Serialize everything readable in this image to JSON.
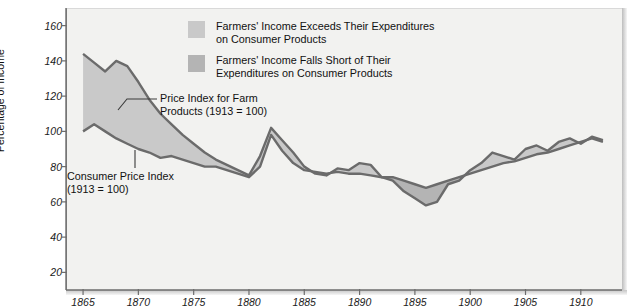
{
  "chart_data": {
    "type": "area",
    "title": "",
    "xlabel": "",
    "ylabel": "Percentage of Income",
    "xlim": [
      1864,
      1913
    ],
    "ylim": [
      10,
      170
    ],
    "yticks": [
      20,
      40,
      60,
      80,
      100,
      120,
      140,
      160
    ],
    "xticks": [
      1865,
      1870,
      1875,
      1880,
      1885,
      1890,
      1895,
      1900,
      1905,
      1910
    ],
    "grid": false,
    "legend_position": "top-center",
    "x": [
      1865,
      1866,
      1867,
      1868,
      1869,
      1870,
      1871,
      1872,
      1873,
      1874,
      1875,
      1876,
      1877,
      1878,
      1879,
      1880,
      1881,
      1882,
      1883,
      1884,
      1885,
      1886,
      1887,
      1888,
      1889,
      1890,
      1891,
      1892,
      1893,
      1894,
      1895,
      1896,
      1897,
      1898,
      1899,
      1900,
      1901,
      1902,
      1903,
      1904,
      1905,
      1906,
      1907,
      1908,
      1909,
      1910,
      1911,
      1912
    ],
    "series": [
      {
        "name": "Price Index for Farm Products (1913 = 100)",
        "values": [
          144,
          139,
          134,
          140,
          137,
          128,
          118,
          110,
          104,
          98,
          93,
          88,
          84,
          81,
          78,
          75,
          86,
          102,
          95,
          88,
          80,
          76,
          75,
          79,
          78,
          82,
          81,
          74,
          72,
          66,
          62,
          58,
          60,
          70,
          72,
          78,
          82,
          88,
          86,
          84,
          90,
          92,
          89,
          94,
          96,
          93,
          97,
          95
        ]
      },
      {
        "name": "Consumer Price Index (1913 = 100)",
        "values": [
          100,
          104,
          100,
          96,
          93,
          90,
          88,
          85,
          86,
          84,
          82,
          80,
          80,
          78,
          76,
          74,
          80,
          98,
          89,
          82,
          78,
          77,
          76,
          77,
          76,
          76,
          75,
          74,
          74,
          72,
          70,
          68,
          70,
          72,
          74,
          76,
          78,
          80,
          82,
          83,
          85,
          87,
          88,
          90,
          92,
          94,
          96,
          94
        ]
      }
    ],
    "fill_above_label": "Farmers' Income Exceeds Their Expenditures on Consumer Products",
    "fill_below_label": "Farmers' Income Falls Short of Their Expenditures on Consumer Products"
  },
  "legend": {
    "items": [
      {
        "label": "Farmers' Income Exceeds Their\nExpenditures on Consumer Products",
        "color": "#c9c9c9"
      },
      {
        "label": "Farmers' Income Falls Short of Their\nExpenditures on Consumer Products",
        "color": "#b4b4b4"
      }
    ]
  },
  "annotations": {
    "farm": "Price Index for Farm\nProducts (1913 = 100)",
    "cpi": "Consumer Price Index\n(1913 = 100)"
  },
  "axes": {
    "y_title": "Percentage of Income",
    "y_ticks": [
      "160",
      "140",
      "120",
      "100",
      "80",
      "60",
      "40",
      "20"
    ],
    "x_ticks": [
      "1865",
      "1870",
      "1875",
      "1880",
      "1885",
      "1890",
      "1895",
      "1900",
      "1905",
      "1910"
    ]
  },
  "colors": {
    "fill_above": "#c9c9c9",
    "fill_below": "#b4b4b4",
    "line": "#6b6b6b",
    "panel": "#f2f2f0",
    "text": "#111111"
  }
}
